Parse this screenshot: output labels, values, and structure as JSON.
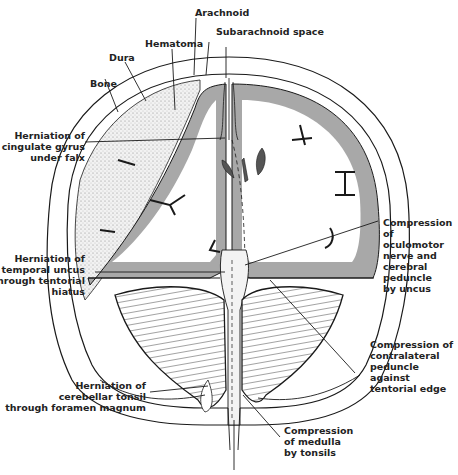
{
  "diagram": {
    "type": "anatomical illustration - coronal section of skull showing brain herniation",
    "colors": {
      "background": "#ffffff",
      "line": "#1a1a1a",
      "gray_matter": "#a8a8a8",
      "white_matter": "#ffffff",
      "hematoma_stipple": "#e6e6e6"
    },
    "labels": {
      "arachnoid": "Arachnoid",
      "subarachnoid_space": "Subarachnoid space",
      "hematoma": "Hematoma",
      "dura": "Dura",
      "bone": "Bone",
      "cingulate": "Herniation of\ncingulate gyrus\nunder falx",
      "uncus": "Herniation of\ntemporal uncus\nthrough tentorial\nhiatus",
      "oculomotor": "Compression\nof\noculomotor\nnerve and\ncerebral\npeduncle\nby uncus",
      "contralateral": "Compression of\ncontralateral\npeduncle\nagainst\ntentorial edge",
      "tonsil": "Herniation of\ncerebellar tonsil\nthrough foramen magnum",
      "medulla": "Compression\nof medulla\nby tonsils"
    }
  }
}
